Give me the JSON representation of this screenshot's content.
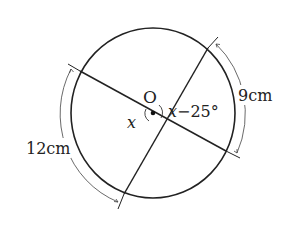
{
  "figure": {
    "center_label": "O",
    "angle_left_label": "x",
    "angle_right_label": "x−25°",
    "arc_left_label": "12cm",
    "arc_right_label": "9cm",
    "arc_left_value": "12",
    "arc_right_value": "9",
    "unit": "cm",
    "colors": {
      "stroke": "#222222",
      "background": "#ffffff"
    }
  }
}
